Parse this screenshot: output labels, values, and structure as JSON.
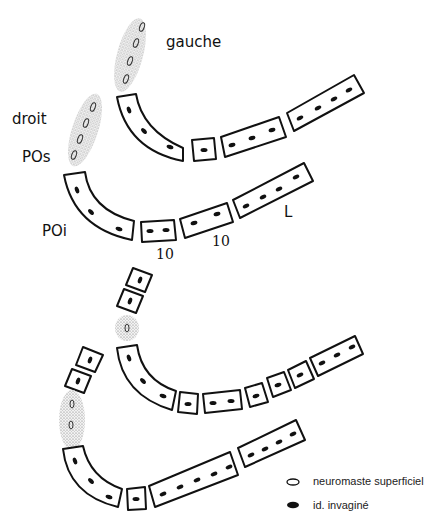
{
  "figure": {
    "labels": {
      "left": "gauche",
      "right": "droit",
      "pos": "POs",
      "poi": "POi",
      "l": "L",
      "ten_a": "10",
      "ten_b": "10"
    },
    "legend": {
      "items": [
        {
          "symbol": "open-ellipse",
          "label": "neuromaste superficiel"
        },
        {
          "symbol": "filled-ellipse",
          "label": "id. invaginé"
        }
      ]
    },
    "colors": {
      "stroke": "#111111",
      "stipple": "#9a9a9a",
      "background": "#ffffff"
    }
  }
}
